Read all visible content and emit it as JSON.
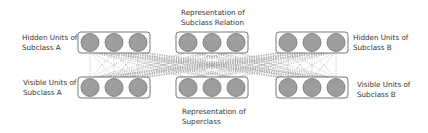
{
  "labels": {
    "hidden_a": [
      "Hidden Units of",
      "Subclass A"
    ],
    "visible_a": [
      "Visible Units of",
      "Subclass A"
    ],
    "relation": [
      "Representation of",
      "Subclass Relation"
    ],
    "superclass": [
      "Representation of",
      "Superclass"
    ],
    "hidden_b": [
      "Hidden Units of",
      "Subclass B"
    ],
    "visible_b": [
      "Visible Units of",
      "Subclass B"
    ]
  },
  "colors": {
    "unit_fill": "#9e9e9e",
    "unit_stroke": "#6f6f6f",
    "box_stroke": "#555555",
    "edge": "#8a8a8a"
  },
  "layers": {
    "columns_x": [
      78,
      176,
      276
    ],
    "box_width": 72,
    "box_height": 21,
    "top_y": 32,
    "bottom_y": 77,
    "units_per_layer": 3
  }
}
